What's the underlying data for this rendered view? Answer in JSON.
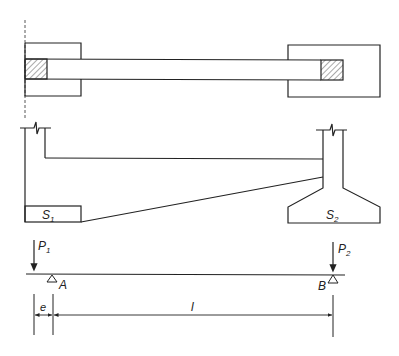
{
  "diagram": {
    "type": "structural-engineering",
    "colors": {
      "line": "#222222",
      "hatch": "#555555",
      "background": "#ffffff"
    },
    "plan_view": {
      "left_footing": {
        "x": 25,
        "y": 43,
        "w": 56,
        "h": 53
      },
      "right_footing": {
        "x": 288,
        "y": 45,
        "w": 92,
        "h": 52
      },
      "strap_beam": {
        "x1": 25,
        "x2": 343,
        "y": 59,
        "h": 20
      },
      "left_column": {
        "x": 25,
        "y": 59,
        "w": 22,
        "h": 20,
        "hatched": true
      },
      "right_column": {
        "x": 321,
        "y": 60,
        "w": 22,
        "h": 20,
        "hatched": true
      }
    },
    "elevation": {
      "left_footing_label": {
        "main": "S",
        "sub": "1"
      },
      "right_footing_label": {
        "main": "S",
        "sub": "2"
      }
    },
    "beam_model": {
      "loads": [
        {
          "main": "P",
          "sub": "1"
        },
        {
          "main": "P",
          "sub": "2"
        }
      ],
      "supports": [
        {
          "label": "A"
        },
        {
          "label": "B"
        }
      ],
      "dimensions": [
        {
          "label": "e"
        },
        {
          "label": "l"
        }
      ]
    }
  }
}
